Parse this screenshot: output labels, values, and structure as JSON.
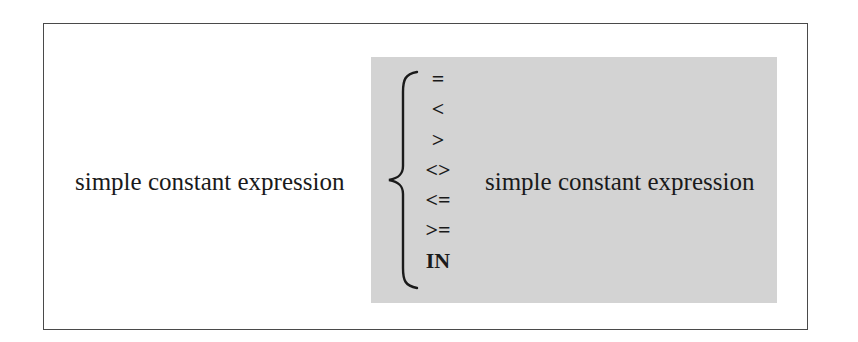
{
  "diagram": {
    "left_operand": "simple constant expression",
    "right_operand": "simple constant expression",
    "operators": [
      "=",
      "<",
      ">",
      "<>",
      "<=",
      ">=",
      "IN"
    ],
    "colors": {
      "border": "#4a4a4a",
      "operator_panel": "#d3d3d3",
      "text": "#1a1a1a"
    }
  }
}
